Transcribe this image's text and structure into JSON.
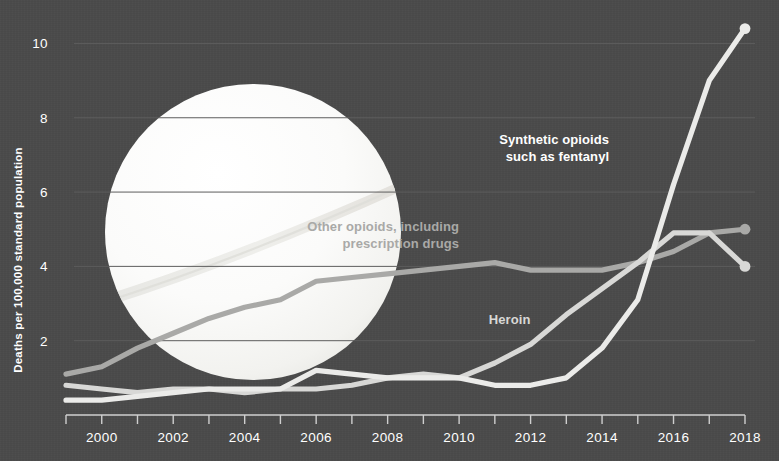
{
  "figure": {
    "background_color": "#4b4b4b",
    "pill_color": "#f7f7f5"
  },
  "chart_data": {
    "type": "line",
    "title": "",
    "subtitle": "",
    "xlabel": "",
    "ylabel": "Deaths per 100,000 standard population",
    "xlim": [
      1999,
      2018
    ],
    "ylim": [
      0,
      10.9
    ],
    "grid": true,
    "grid_axis": "y",
    "legend_position": "inline-annotations",
    "x": [
      1999,
      2000,
      2001,
      2002,
      2003,
      2004,
      2005,
      2006,
      2007,
      2008,
      2009,
      2010,
      2011,
      2012,
      2013,
      2014,
      2015,
      2016,
      2017,
      2018
    ],
    "xticks": [
      2000,
      2002,
      2004,
      2006,
      2008,
      2010,
      2012,
      2014,
      2016,
      2018
    ],
    "xtick_labels": [
      "2000",
      "2002",
      "2004",
      "2006",
      "2008",
      "2010",
      "2012",
      "2014",
      "2016",
      "2018"
    ],
    "yticks": [
      2,
      4,
      6,
      8,
      10
    ],
    "ytick_labels": [
      "2",
      "4",
      "6",
      "8",
      "10"
    ],
    "series": [
      {
        "name": "Other opioids, including prescription drugs",
        "label_lines": [
          "Other opioids, including",
          "prescription drugs"
        ],
        "color": "#a9a9a7",
        "label_color": "#a9a9a7",
        "label_x": 2010.0,
        "label_y": 4.95,
        "end_marker": true,
        "end_value": 5.0,
        "values": [
          1.1,
          1.3,
          1.8,
          2.2,
          2.6,
          2.9,
          3.1,
          3.6,
          3.7,
          3.8,
          3.9,
          4.0,
          4.1,
          3.9,
          3.9,
          3.9,
          4.1,
          4.4,
          4.9,
          5.0
        ]
      },
      {
        "name": "Heroin",
        "label_lines": [
          "Heroin"
        ],
        "color": "#d8d8d6",
        "label_color": "#d8d8d6",
        "label_x": 2012.0,
        "label_y": 2.45,
        "end_marker": true,
        "end_value": 4.0,
        "values": [
          0.8,
          0.7,
          0.6,
          0.7,
          0.7,
          0.6,
          0.7,
          0.7,
          0.8,
          1.0,
          1.1,
          1.0,
          1.4,
          1.9,
          2.7,
          3.4,
          4.1,
          4.9,
          4.9,
          4.0
        ]
      },
      {
        "name": "Synthetic opioids such as fentanyl",
        "label_lines": [
          "Synthetic opioids",
          "such as fentanyl"
        ],
        "color": "#ebebe9",
        "label_color": "#ffffff",
        "label_x": 2014.2,
        "label_y": 7.3,
        "end_marker": true,
        "end_value": 10.4,
        "values": [
          0.4,
          0.4,
          0.5,
          0.6,
          0.7,
          0.7,
          0.7,
          1.2,
          1.1,
          1.0,
          1.0,
          1.0,
          0.8,
          0.8,
          1.0,
          1.8,
          3.1,
          6.2,
          9.0,
          10.4
        ]
      }
    ]
  }
}
